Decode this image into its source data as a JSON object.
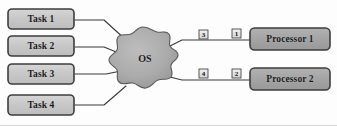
{
  "diagram": {
    "background_color": "#fdfdfd",
    "line_color": "#3a3a3a",
    "task_fill": "#c9c9c9",
    "task_border": "#3d3d3d",
    "processor_fill": "#a6a6a6",
    "processor_border": "#3d3d3d",
    "os_fill": "#a9a9a9",
    "os_border": "#555555",
    "badge_fill": "#e2e2e2",
    "badge_border": "#4a4a4a"
  },
  "tasks": [
    {
      "label": "Task 1",
      "x": 8,
      "y": 9,
      "w": 66,
      "h": 20
    },
    {
      "label": "Task 2",
      "x": 8,
      "y": 36,
      "w": 66,
      "h": 20
    },
    {
      "label": "Task 3",
      "x": 8,
      "y": 64,
      "w": 66,
      "h": 20
    },
    {
      "label": "Task 4",
      "x": 8,
      "y": 95,
      "w": 66,
      "h": 20
    }
  ],
  "os": {
    "label": "OS",
    "cx": 143,
    "cy": 62,
    "rx": 32,
    "ry": 35
  },
  "processors": [
    {
      "label": "Processor 1",
      "x": 250,
      "y": 28,
      "w": 80,
      "h": 22
    },
    {
      "label": "Processor 2",
      "x": 250,
      "y": 68,
      "w": 80,
      "h": 22
    }
  ],
  "badges": [
    {
      "label": "3",
      "x": 199,
      "y": 30,
      "size": 9
    },
    {
      "label": "1",
      "x": 232,
      "y": 29,
      "size": 9
    },
    {
      "label": "4",
      "x": 199,
      "y": 69,
      "size": 9
    },
    {
      "label": "2",
      "x": 232,
      "y": 69,
      "size": 9
    }
  ],
  "connections": [
    {
      "from": "Task 1",
      "to": "OS",
      "path": "M 75,20 L 104,20 L 126,40"
    },
    {
      "from": "Task 2",
      "to": "OS",
      "path": "M 75,47 L 104,47 L 121,54"
    },
    {
      "from": "Task 3",
      "to": "OS",
      "path": "M 75,74 L 106,74 L 121,71"
    },
    {
      "from": "Task 4",
      "to": "OS",
      "path": "M 75,105 L 104,105 L 126,86"
    },
    {
      "from": "OS",
      "to": "Processor 1",
      "path": "M 166,48 L 182,40 L 251,40"
    },
    {
      "from": "OS",
      "to": "Processor 2",
      "path": "M 166,76 L 182,80 L 251,80"
    }
  ]
}
